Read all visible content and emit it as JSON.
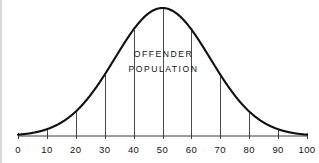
{
  "figure": {
    "background_color": "#ffffff",
    "curve_color": "#101010",
    "axis_color": "#3a3a3a",
    "gridline_color": "#4a4a4a",
    "text_color": "#111111",
    "annotation_line_1": "OFFENDER",
    "annotation_line_2": "POPULATION"
  },
  "chart_data": {
    "type": "line",
    "title": "",
    "subtitle": "",
    "xlabel": "",
    "ylabel": "",
    "distribution": "normal",
    "mean": 50,
    "std_dev": 16.5,
    "xlim": [
      0,
      100
    ],
    "ylim": [
      0,
      1
    ],
    "grid": false,
    "legend": null,
    "annotations": [
      {
        "text": "OFFENDER",
        "x": 50,
        "y": 0.62
      },
      {
        "text": "POPULATION",
        "x": 50,
        "y": 0.5
      }
    ],
    "xticks": [
      0,
      10,
      20,
      30,
      40,
      50,
      60,
      70,
      80,
      90,
      100
    ],
    "xtick_labels": [
      "0",
      "10",
      "20",
      "30",
      "40",
      "50",
      "60",
      "70",
      "80",
      "90",
      "100"
    ],
    "ordinate_lines_at": [
      10,
      20,
      30,
      40,
      50,
      60,
      70,
      80,
      90
    ],
    "x": [
      0,
      5,
      10,
      15,
      20,
      25,
      30,
      35,
      40,
      45,
      50,
      55,
      60,
      65,
      70,
      75,
      80,
      85,
      90,
      95,
      100
    ],
    "values": [
      0.011,
      0.026,
      0.055,
      0.104,
      0.179,
      0.281,
      0.403,
      0.528,
      0.665,
      0.831,
      1.0,
      0.831,
      0.665,
      0.528,
      0.403,
      0.281,
      0.179,
      0.104,
      0.055,
      0.026,
      0.011
    ]
  }
}
